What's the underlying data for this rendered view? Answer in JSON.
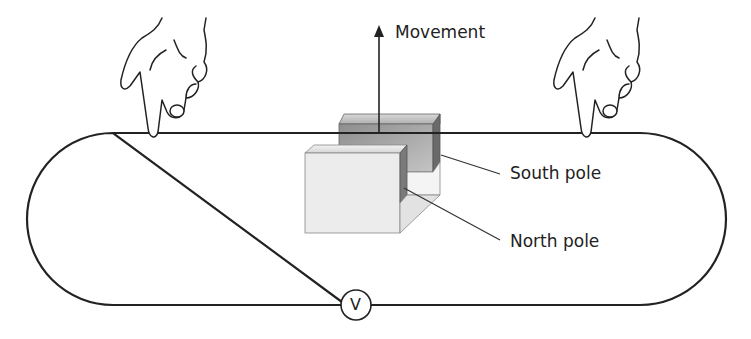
{
  "labels": {
    "movement": "Movement",
    "south_pole": "South pole",
    "north_pole": "North pole",
    "voltmeter": "V"
  },
  "colors": {
    "line": "#222222",
    "north_face": "#ececec",
    "south_face": "#9a9a9a"
  }
}
